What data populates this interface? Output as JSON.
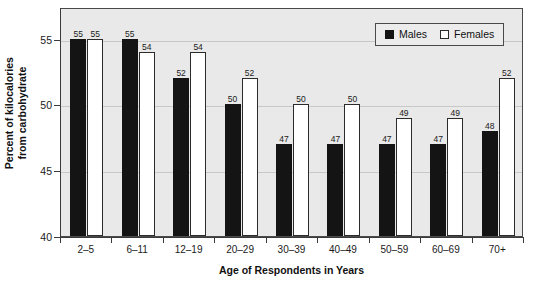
{
  "chart_data": {
    "type": "bar",
    "title": "",
    "categories": [
      "2–5",
      "6–11",
      "12–19",
      "20–29",
      "30–39",
      "40–49",
      "50–59",
      "60–69",
      "70+"
    ],
    "series": [
      {
        "name": "Males",
        "color": "#141414",
        "values": [
          55,
          55,
          52,
          50,
          47,
          47,
          47,
          47,
          48
        ]
      },
      {
        "name": "Females",
        "color": "#ffffff",
        "values": [
          55,
          54,
          54,
          52,
          50,
          50,
          49,
          49,
          52
        ]
      }
    ],
    "xlabel": "Age of Respondents in Years",
    "ylabel": "Percent of kilocalories from carbohydrate",
    "ylabel_line1": "Percent of kilocalories",
    "ylabel_line2": "from carbohydrate",
    "ylim": [
      40,
      57.4
    ],
    "yticks": [
      40,
      45,
      50,
      55
    ],
    "ytick_labels": [
      "40",
      "45",
      "50",
      "55"
    ],
    "gridlines": [
      45,
      50,
      55
    ],
    "grid": true,
    "legend_position": "top-right",
    "data_labels": true,
    "plot_background": "#e9e9e9",
    "axis_color": "#3b3b3b",
    "grid_color": "#c8c8c8"
  },
  "legend": {
    "items": [
      {
        "label": "Males",
        "swatch": "filled-black-square"
      },
      {
        "label": "Females",
        "swatch": "open-white-square"
      }
    ]
  }
}
